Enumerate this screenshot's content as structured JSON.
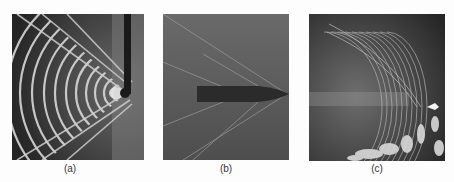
{
  "figure": {
    "panels": [
      {
        "id": "a",
        "label": "(a)",
        "subject": "circular wave fronts with V-shaped shock from probe tip"
      },
      {
        "id": "b",
        "label": "(b)",
        "subject": "bullet in supersonic flight with conical shock waves"
      },
      {
        "id": "c",
        "label": "(c)",
        "subject": "curved striated wave fronts ahead of bright source with turbulent wake"
      }
    ]
  },
  "colors": {
    "background": "#fdfdfd",
    "panel_a_bg": "#2e2e2e",
    "panel_b_bg": "#5a5a5a",
    "panel_c_bg": "#333333",
    "caption": "#333333"
  }
}
